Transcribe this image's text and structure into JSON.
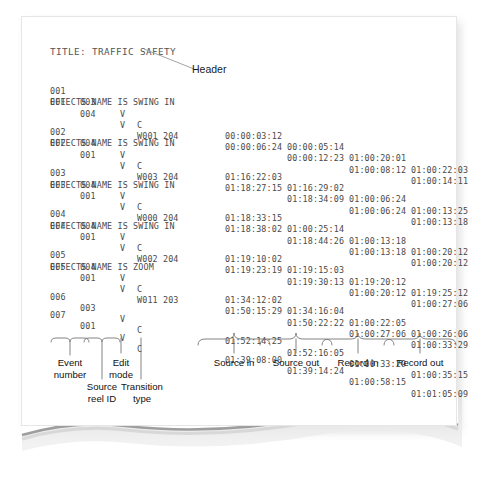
{
  "document": {
    "title_line": "TITLE: TRAFFIC SAFETY",
    "header_callout": "Header"
  },
  "columns": {
    "event_number": "Event\nnumber",
    "source_reel_id": "Source\nreel ID",
    "edit_mode": "Edit\nmode",
    "transition_type": "Transition\ntype",
    "source_in": "Source in",
    "source_out": "Source out",
    "record_in": "Record in",
    "record_out": "Record out"
  },
  "edl": {
    "events": [
      {
        "lines": [
          {
            "event": "001",
            "reel": "003",
            "mode": "V",
            "transition": "C",
            "source_in": "00:00:03:12",
            "source_out": "00:00:05:14",
            "record_in": "01:00:20:01",
            "record_out": "01:00:22:03"
          },
          {
            "event": "001",
            "reel": "004",
            "mode": "V",
            "transition": "W001 204",
            "source_in": "00:00:06:24",
            "source_out": "00:00:12:23",
            "record_in": "01:00:08:12",
            "record_out": "01:00:14:11"
          }
        ],
        "effect": "EFFECTS NAME IS SWING IN"
      },
      {
        "lines": [
          {
            "event": "002",
            "reel": "004",
            "mode": "V",
            "transition": "C",
            "source_in": "01:16:22:03",
            "source_out": "01:16:29:02",
            "record_in": "01:00:06:24",
            "record_out": "01:00:13:25"
          },
          {
            "event": "002",
            "reel": "001",
            "mode": "V",
            "transition": "W003 204",
            "source_in": "01:18:27:15",
            "source_out": "01:18:34:09",
            "record_in": "01:00:06:24",
            "record_out": "01:00:13:18"
          }
        ],
        "effect": "EFFECTS NAME IS SWING IN"
      },
      {
        "lines": [
          {
            "event": "003",
            "reel": "004",
            "mode": "V",
            "transition": "C",
            "source_in": "01:18:33:15",
            "source_out": "01:00:25:14",
            "record_in": "01:00:13:18",
            "record_out": "01:00:20:12"
          },
          {
            "event": "003",
            "reel": "001",
            "mode": "V",
            "transition": "W000 204",
            "source_in": "01:18:38:02",
            "source_out": "01:18:44:26",
            "record_in": "01:00:13:18",
            "record_out": "01:00:20:12"
          }
        ],
        "effect": "EFFECTS NAME IS SWING IN"
      },
      {
        "lines": [
          {
            "event": "004",
            "reel": "004",
            "mode": "V",
            "transition": "C",
            "source_in": "01:19:10:02",
            "source_out": "01:19:15:03",
            "record_in": "01:19:20:12",
            "record_out": "01:19:25:12"
          },
          {
            "event": "004",
            "reel": "001",
            "mode": "V",
            "transition": "W002 204",
            "source_in": "01:19:23:19",
            "source_out": "01:19:30:13",
            "record_in": "01:00:20:12",
            "record_out": "01:00:27:06"
          }
        ],
        "effect": "EFFECTS NAME IS SWING IN"
      },
      {
        "lines": [
          {
            "event": "005",
            "reel": "004",
            "mode": "V",
            "transition": "C",
            "source_in": "01:34:12:02",
            "source_out": "01:34:16:04",
            "record_in": "01:00:22:05",
            "record_out": "01:00:26:06"
          },
          {
            "event": "005",
            "reel": "001",
            "mode": "V",
            "transition": "W011 203",
            "source_in": "01:50:15:29",
            "source_out": "01:50:22:22",
            "record_in": "01:00:27:06",
            "record_out": "01:00:33:29"
          }
        ],
        "effect": "EFFECTS NAME IS ZOOM"
      },
      {
        "lines": [
          {
            "event": "006",
            "reel": "003",
            "mode": "V",
            "transition": "C",
            "source_in": "01:52:14:25",
            "source_out": "01:52:16:05",
            "record_in": "01:00:33:29",
            "record_out": "01:00:35:15"
          }
        ],
        "effect": ""
      },
      {
        "lines": [
          {
            "event": "007",
            "reel": "001",
            "mode": "V",
            "transition": "C",
            "source_in": "01:39:08:00",
            "source_out": "01:39:14:24",
            "record_in": "01:00:58:15",
            "record_out": "01:01:05:09"
          }
        ],
        "effect": ""
      }
    ]
  },
  "colors": {
    "paper": "#ffffff",
    "page_shadow": "#d8d8d8",
    "mono_text": "#4a4a4a",
    "label_text": "#111111",
    "rule": "#8a8a8a"
  }
}
